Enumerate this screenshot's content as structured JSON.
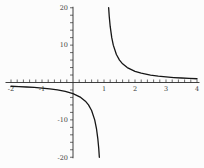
{
  "figure": {
    "background_color": "#fcfcfc",
    "curve_color": "#161616",
    "axis_color": "#2b2b2b",
    "tick_color": "#2b2b2b",
    "label_color": "#3a3a3a"
  },
  "chart_data": {
    "type": "line",
    "title": "",
    "xlabel": "",
    "ylabel": "",
    "legend": "none",
    "grid": false,
    "x_range": [
      -2,
      4
    ],
    "y_range": [
      -20,
      20
    ],
    "x_minor_tick_step": 0.2,
    "y_minor_tick_step": 2,
    "x_ticks": [
      {
        "value": -2,
        "label": "-2"
      },
      {
        "value": -1,
        "label": "-1"
      },
      {
        "value": 1,
        "label": "1"
      },
      {
        "value": 2,
        "label": "2"
      },
      {
        "value": 3,
        "label": "3"
      },
      {
        "value": 4,
        "label": "4"
      }
    ],
    "y_ticks": [
      {
        "value": 20,
        "label": "20"
      },
      {
        "value": 10,
        "label": "10"
      },
      {
        "value": -10,
        "label": "-10"
      },
      {
        "value": -20,
        "label": "-20"
      }
    ],
    "vertical_asymptote_x": 1,
    "horizontal_asymptote_y": 0,
    "series": [
      {
        "name": "left-branch",
        "points": [
          [
            -2,
            -1
          ],
          [
            -1.75,
            -1.09
          ],
          [
            -1.5,
            -1.2
          ],
          [
            -1.25,
            -1.33
          ],
          [
            -1,
            -1.5
          ],
          [
            -0.75,
            -1.71
          ],
          [
            -0.5,
            -2
          ],
          [
            -0.25,
            -2.4
          ],
          [
            0,
            -3
          ],
          [
            0.25,
            -4
          ],
          [
            0.4,
            -5
          ],
          [
            0.5,
            -6
          ],
          [
            0.6,
            -7.5
          ],
          [
            0.7,
            -10
          ],
          [
            0.76,
            -12.5
          ],
          [
            0.8,
            -15
          ],
          [
            0.83,
            -17.6
          ],
          [
            0.85,
            -20
          ]
        ]
      },
      {
        "name": "right-branch",
        "points": [
          [
            1.15,
            20
          ],
          [
            1.17,
            17.6
          ],
          [
            1.2,
            15
          ],
          [
            1.25,
            12
          ],
          [
            1.3,
            10
          ],
          [
            1.4,
            7.5
          ],
          [
            1.5,
            6
          ],
          [
            1.6,
            5
          ],
          [
            1.75,
            4
          ],
          [
            2,
            3
          ],
          [
            2.2,
            2.5
          ],
          [
            2.5,
            2
          ],
          [
            2.75,
            1.71
          ],
          [
            3,
            1.5
          ],
          [
            3.25,
            1.33
          ],
          [
            3.5,
            1.2
          ],
          [
            3.75,
            1.09
          ],
          [
            4,
            1
          ]
        ]
      }
    ]
  }
}
